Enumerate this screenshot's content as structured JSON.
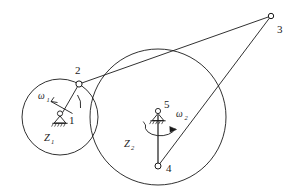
{
  "figure": {
    "type": "kinematic-mechanism-diagram",
    "background_color": "#ffffff",
    "stroke_color": "#1a1a1a",
    "width": 297,
    "height": 195
  },
  "labels": {
    "joint_1": "1",
    "joint_2": "2",
    "joint_3": "3",
    "joint_4": "4",
    "joint_5": "5",
    "omega_1": "ω",
    "omega_1_sub": "1",
    "omega_2": "ω",
    "omega_2_sub": "2",
    "gear_1": "Z",
    "gear_1_sub": "1",
    "gear_2": "Z",
    "gear_2_sub": "2"
  },
  "geometry": {
    "circle_small": {
      "cx": 60,
      "cy": 117,
      "r": 38
    },
    "circle_large": {
      "cx": 158,
      "cy": 117,
      "r": 68
    },
    "point_1": {
      "x": 60,
      "y": 117
    },
    "point_2": {
      "x": 79,
      "y": 84
    },
    "point_3": {
      "x": 271,
      "y": 16
    },
    "point_4": {
      "x": 158,
      "y": 166
    },
    "point_5": {
      "x": 158,
      "y": 115
    }
  }
}
